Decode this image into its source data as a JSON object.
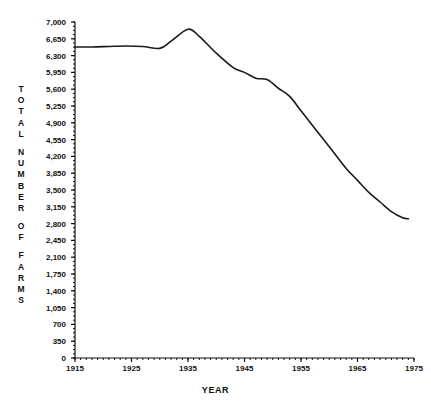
{
  "chart_data": {
    "type": "line",
    "title": "",
    "xlabel": "YEAR",
    "ylabel": "TOTAL NUMBER OF FARMS",
    "ylabel_chars": [
      "T",
      "O",
      "T",
      "A",
      "L",
      "",
      "N",
      "U",
      "M",
      "B",
      "E",
      "R",
      "",
      "O",
      "F",
      "",
      "F",
      "A",
      "R",
      "M",
      "S"
    ],
    "xlim": [
      1915,
      1975
    ],
    "ylim": [
      0,
      7000
    ],
    "grid": false,
    "legend": null,
    "line_color": "#1a1a1a",
    "line_width": 1.6,
    "x_major_ticks": [
      1915,
      1925,
      1935,
      1945,
      1955,
      1965,
      1975
    ],
    "x_major_tick_labels": [
      "1915",
      "1925",
      "1935",
      "1945",
      "1955",
      "1965",
      "1975"
    ],
    "x_minor_tick_step": 1,
    "y_major_ticks": [
      0,
      350,
      700,
      1050,
      1400,
      1750,
      2100,
      2450,
      2800,
      3150,
      3500,
      3850,
      4200,
      4550,
      4900,
      5250,
      5600,
      5950,
      6300,
      6650,
      7000
    ],
    "y_major_tick_labels": [
      "0",
      "350",
      "700",
      "1,050",
      "1,400",
      "1,750",
      "2,100",
      "2,450",
      "2,800",
      "3,150",
      "3,500",
      "3,850",
      "4,200",
      "4,550",
      "4,900",
      "5,250",
      "5,600",
      "5,950",
      "6,300",
      "6,650",
      "7,000"
    ],
    "y_minor_tick_step": 87.5,
    "x": [
      1915,
      1918,
      1921,
      1924,
      1927,
      1930,
      1932,
      1935,
      1937,
      1940,
      1943,
      1945,
      1947,
      1949,
      1951,
      1953,
      1955,
      1957,
      1959,
      1961,
      1963,
      1965,
      1967,
      1969,
      1971,
      1973,
      1974
    ],
    "values": [
      6480,
      6480,
      6490,
      6500,
      6490,
      6450,
      6600,
      6850,
      6700,
      6350,
      6050,
      5950,
      5830,
      5800,
      5620,
      5450,
      5150,
      4850,
      4550,
      4250,
      3950,
      3700,
      3450,
      3250,
      3050,
      2920,
      2900
    ],
    "series": [
      {
        "name": "Total number of farms",
        "values": [
          6480,
          6480,
          6490,
          6500,
          6490,
          6450,
          6600,
          6850,
          6700,
          6350,
          6050,
          5950,
          5830,
          5800,
          5620,
          5450,
          5150,
          4850,
          4550,
          4250,
          3950,
          3700,
          3450,
          3250,
          3050,
          2920,
          2900
        ]
      }
    ]
  },
  "axes": {
    "plot_left_px": 75,
    "plot_right_px": 414,
    "plot_top_px": 22,
    "plot_bottom_px": 358
  }
}
